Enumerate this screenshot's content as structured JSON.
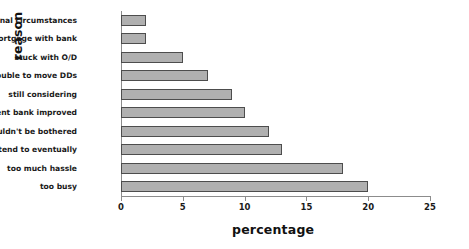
{
  "chart_data": {
    "type": "bar",
    "orientation": "horizontal",
    "title": "",
    "xlabel": "percentage",
    "ylabel": "reason",
    "xlim": [
      0,
      25
    ],
    "xticks": [
      0,
      5,
      10,
      15,
      20,
      25
    ],
    "xtick_labels": [
      "0",
      "5",
      "10",
      "15",
      "20",
      "25"
    ],
    "grid": false,
    "legend": "none",
    "bar_fill_color": "#b0b0b0",
    "bar_edge_color": "#4d4d4d",
    "axis_color": "#8c8c8c",
    "categories": [
      "personal circumstances",
      "have a mortgage with bank",
      "stuck with O/D",
      "too much trouble to move DDs",
      "still considering",
      "present bank improved",
      "couldn't be bothered",
      "I do intend to eventually",
      "too much hassle",
      "too busy"
    ],
    "values": [
      2,
      2,
      5,
      7,
      9,
      10,
      12,
      13,
      18,
      20
    ]
  }
}
